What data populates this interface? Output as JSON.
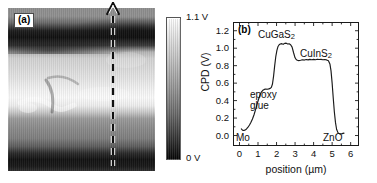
{
  "figure": {
    "panels": [
      {
        "id": "a",
        "label": "(a)",
        "type": "kpfm-cpd-map",
        "scan_arrow": "upward-dashed-arrow"
      },
      {
        "id": "b",
        "label": "(b)",
        "type": "line-profile"
      }
    ]
  },
  "colorbar": {
    "max_label": "1.1 V",
    "min_label": "0 V",
    "top_color": "#ffffff",
    "bottom_color": "#050505",
    "quantity": "CPD"
  },
  "chart_data": {
    "type": "line",
    "title": "(b)",
    "xlabel": "position (µm)",
    "ylabel": "CPD (V)",
    "xlim": [
      -0.35,
      6.45
    ],
    "ylim": [
      -0.12,
      1.3
    ],
    "xticks": [
      0,
      1,
      2,
      3,
      4,
      5,
      6
    ],
    "xtick_labels": [
      "0",
      "1",
      "2",
      "3",
      "4",
      "5",
      "6"
    ],
    "yticks": [
      0.0,
      0.2,
      0.4,
      0.6,
      0.8,
      1.0,
      1.2
    ],
    "ytick_labels": [
      "0.0",
      "0.2",
      "0.4",
      "0.6",
      "0.8",
      "1.0",
      "1.2"
    ],
    "grid": false,
    "legend": null,
    "series": [
      {
        "name": "CPD line profile",
        "color": "#1a1a1a",
        "x": [
          0.1,
          0.16,
          0.22,
          0.3,
          0.38,
          0.46,
          0.54,
          0.62,
          0.7,
          0.78,
          0.86,
          0.94,
          1.02,
          1.1,
          1.18,
          1.26,
          1.34,
          1.42,
          1.5,
          1.58,
          1.66,
          1.72,
          1.78,
          1.84,
          1.9,
          1.96,
          2.02,
          2.08,
          2.14,
          2.2,
          2.28,
          2.36,
          2.44,
          2.52,
          2.6,
          2.68,
          2.76,
          2.84,
          2.92,
          3.0,
          3.06,
          3.12,
          3.2,
          3.3,
          3.4,
          3.5,
          3.6,
          3.7,
          3.8,
          3.9,
          4.0,
          4.1,
          4.2,
          4.3,
          4.4,
          4.5,
          4.6,
          4.7,
          4.8,
          4.88,
          4.94,
          5.0,
          5.06,
          5.12,
          5.18,
          5.24,
          5.32,
          5.42,
          5.54,
          5.64
        ],
        "y": [
          0.075,
          0.062,
          0.058,
          0.062,
          0.075,
          0.095,
          0.12,
          0.152,
          0.19,
          0.235,
          0.29,
          0.35,
          0.41,
          0.46,
          0.498,
          0.518,
          0.528,
          0.532,
          0.53,
          0.534,
          0.54,
          0.552,
          0.59,
          0.68,
          0.8,
          0.905,
          0.975,
          1.02,
          1.04,
          1.048,
          1.052,
          1.044,
          1.055,
          1.058,
          1.048,
          1.05,
          1.04,
          1.012,
          0.948,
          0.89,
          0.87,
          0.862,
          0.858,
          0.862,
          0.868,
          0.864,
          0.87,
          0.866,
          0.872,
          0.868,
          0.872,
          0.868,
          0.874,
          0.87,
          0.872,
          0.868,
          0.87,
          0.866,
          0.856,
          0.82,
          0.74,
          0.6,
          0.43,
          0.27,
          0.15,
          0.072,
          0.03,
          0.018,
          0.022,
          0.028
        ]
      }
    ],
    "annotations": [
      {
        "id": "cugas2",
        "text_html": "CuGaS<sub>2</sub>",
        "text": "CuGaS2",
        "x": 2.5,
        "y": 1.16
      },
      {
        "id": "cuins2",
        "text_html": "CuInS<sub>2</sub>",
        "text": "CuInS2",
        "x": 3.9,
        "y": 0.97
      },
      {
        "id": "epoxy",
        "text": "epoxy\nglue",
        "line1": "epoxy",
        "line2": "glue",
        "x": 1.45,
        "y": 0.4
      },
      {
        "id": "mo",
        "text": "Mo",
        "x": 0.18,
        "y": -0.02
      },
      {
        "id": "zno",
        "text": "ZnO",
        "x": 5.35,
        "y": -0.02
      }
    ]
  }
}
